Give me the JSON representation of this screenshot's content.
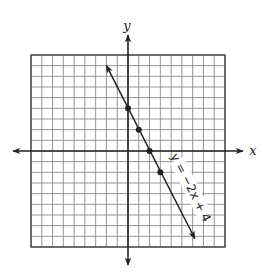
{
  "axes": {
    "x_label": "x",
    "y_label": "y",
    "x_range": [
      -9,
      9
    ],
    "y_range": [
      -9,
      9
    ],
    "grid": true,
    "grid_step": 1
  },
  "line": {
    "equation_label": "y = −2x + 4",
    "slope": -2,
    "intercept": 4,
    "color": "#222222",
    "points": [
      {
        "x": 0,
        "y": 4
      },
      {
        "x": 1,
        "y": 2
      },
      {
        "x": 2,
        "y": 0
      },
      {
        "x": 3,
        "y": -2
      }
    ],
    "endpoints": [
      {
        "x": -2,
        "y": 8
      },
      {
        "x": 6.2,
        "y": -8.2
      }
    ]
  },
  "colors": {
    "grid": "#8a8a8a",
    "border": "#444444",
    "axis": "#222222",
    "background": "#ffffff"
  }
}
